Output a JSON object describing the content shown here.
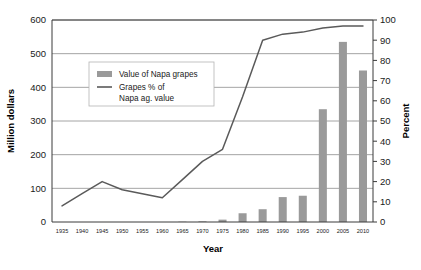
{
  "chart_data": {
    "type": "bar",
    "title": "",
    "xlabel": "Year",
    "ylabel": "Million dollars",
    "y2label": "Percent",
    "grid": true,
    "legend_position": "upper-left-inside",
    "x": [
      1935,
      1940,
      1945,
      1950,
      1955,
      1960,
      1965,
      1970,
      1975,
      1980,
      1985,
      1990,
      1995,
      2000,
      2005,
      2010
    ],
    "categories": [
      "1935",
      "1940",
      "1945",
      "1950",
      "1955",
      "1960",
      "1965",
      "1970",
      "1975",
      "1980",
      "1985",
      "1990",
      "1995",
      "2000",
      "2005",
      "2010"
    ],
    "ylim": [
      0,
      600
    ],
    "ylim2": [
      0,
      100
    ],
    "yticks": [
      0,
      100,
      200,
      300,
      400,
      500,
      600
    ],
    "yticks2": [
      0,
      10,
      20,
      30,
      40,
      50,
      60,
      70,
      80,
      90,
      100
    ],
    "ytick_labels": [
      "0",
      "100",
      "200",
      "300",
      "400",
      "500",
      "600"
    ],
    "ytick2_labels": [
      "0",
      "10",
      "20",
      "30",
      "40",
      "50",
      "60",
      "70",
      "80",
      "90",
      "100"
    ],
    "series": [
      {
        "name": "Value of Napa grapes",
        "type": "bar",
        "axis": "left",
        "unit": "million dollars",
        "color": "#9a9a9a",
        "values": [
          0,
          0,
          0,
          0,
          0,
          0,
          1,
          2,
          7,
          26,
          38,
          74,
          78,
          335,
          535,
          450
        ]
      },
      {
        "name": "Grapes % of Napa ag. value",
        "type": "line",
        "axis": "right",
        "unit": "percent",
        "color": "#5a5a5a",
        "values": [
          8,
          14,
          20,
          16,
          14,
          12,
          21,
          30,
          36,
          62,
          90,
          93,
          94,
          96,
          97,
          97
        ]
      }
    ],
    "legend": [
      {
        "label": "Value of Napa grapes",
        "marker": "bar-swatch",
        "color": "#9a9a9a"
      },
      {
        "label": "Grapes % of",
        "label2": "Napa ag. value",
        "marker": "line-swatch",
        "color": "#5a5a5a"
      }
    ]
  }
}
